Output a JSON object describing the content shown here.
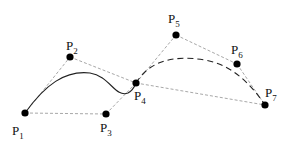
{
  "diagram": {
    "colors": {
      "background": "#ffffff",
      "point": "#000000",
      "curve": "#222222",
      "control_polygon": "#a8a8a8",
      "label": "#111111"
    },
    "points": [
      {
        "id": "P1",
        "letter": "P",
        "sub": "1",
        "x": 25,
        "y": 113,
        "label_x": 12,
        "label_y": 124
      },
      {
        "id": "P2",
        "letter": "P",
        "sub": "2",
        "x": 70,
        "y": 57,
        "label_x": 66,
        "label_y": 39
      },
      {
        "id": "P3",
        "letter": "P",
        "sub": "3",
        "x": 106,
        "y": 114,
        "label_x": 100,
        "label_y": 121
      },
      {
        "id": "P4",
        "letter": "P",
        "sub": "4",
        "x": 136,
        "y": 83,
        "label_x": 134,
        "label_y": 89
      },
      {
        "id": "P5",
        "letter": "P",
        "sub": "5",
        "x": 176,
        "y": 35,
        "label_x": 168,
        "label_y": 12
      },
      {
        "id": "P6",
        "letter": "P",
        "sub": "6",
        "x": 237,
        "y": 64,
        "label_x": 231,
        "label_y": 43
      },
      {
        "id": "P7",
        "letter": "P",
        "sub": "7",
        "x": 265,
        "y": 105,
        "label_x": 265,
        "label_y": 86
      }
    ],
    "control_lines": [
      [
        "P1",
        "P2"
      ],
      [
        "P2",
        "P4"
      ],
      [
        "P1",
        "P3"
      ],
      [
        "P3",
        "P4"
      ],
      [
        "P4",
        "P5"
      ],
      [
        "P5",
        "P6"
      ],
      [
        "P6",
        "P7"
      ],
      [
        "P4",
        "P7"
      ]
    ],
    "curves": [
      {
        "name": "segment-1",
        "style": "solid",
        "path": "M25,113 C45,85 65,70 90,73 C110,76 115,98 128,93 C132,91 134,88 136,83"
      },
      {
        "name": "segment-2",
        "style": "dashed",
        "path": "M136,83 C150,60 175,55 205,60 C235,65 255,90 265,105"
      }
    ]
  }
}
